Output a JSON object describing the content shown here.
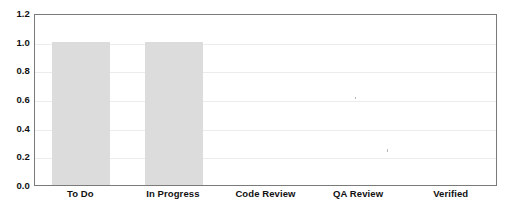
{
  "chart_data": {
    "type": "bar",
    "title": "",
    "xlabel": "",
    "ylabel": "",
    "categories": [
      "To Do",
      "In Progress",
      "Code Review",
      "QA Review",
      "Verified"
    ],
    "values": [
      1.0,
      1.0,
      0,
      0,
      0
    ],
    "ylim": [
      0.0,
      1.2
    ],
    "yticks": [
      "0.0",
      "0.2",
      "0.4",
      "0.6",
      "0.8",
      "1.0",
      "1.2"
    ],
    "ytick_values": [
      0.0,
      0.2,
      0.4,
      0.6,
      0.8,
      1.0,
      1.2
    ],
    "grid": true,
    "legend": null,
    "colors": {
      "bar_fill": "#dcdcdc",
      "grid": "#ececec",
      "spine": "#7a7a7a",
      "text": "#111111",
      "background": "#ffffff"
    }
  }
}
